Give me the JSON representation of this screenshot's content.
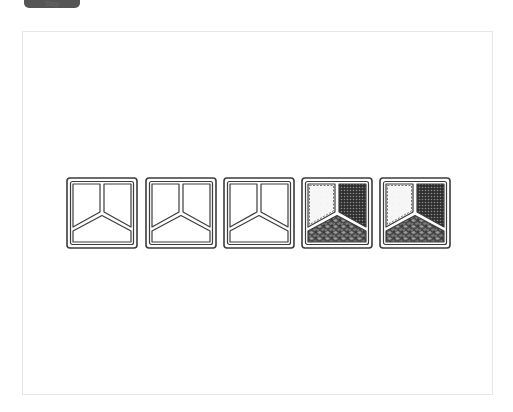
{
  "top_tab": {
    "label": "Step"
  },
  "diagram": {
    "trays": [
      {
        "index": 1,
        "state": "empty",
        "x": 66
      },
      {
        "index": 2,
        "state": "empty",
        "x": 145
      },
      {
        "index": 3,
        "state": "empty",
        "x": 223
      },
      {
        "index": 4,
        "state": "filled",
        "x": 301
      },
      {
        "index": 5,
        "state": "filled",
        "x": 379
      }
    ],
    "compartments": {
      "top_left": {
        "fill": "light-speckled",
        "color": "#f4f4f4"
      },
      "top_right": {
        "fill": "dark-dotted",
        "color": "#3a3a3a"
      },
      "bottom": {
        "fill": "dark-chunky",
        "color": "#555555"
      }
    },
    "colors": {
      "outline": "#3c3c3c",
      "background": "#ffffff",
      "canvas_border": "#e6e6e6",
      "tab": "#555555"
    }
  }
}
